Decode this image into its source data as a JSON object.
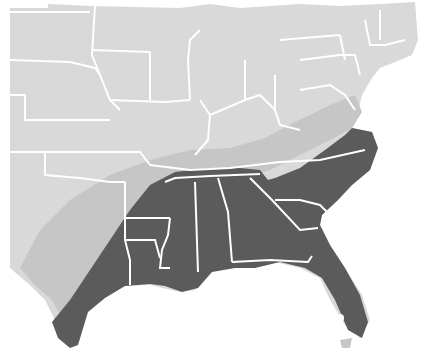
{
  "map": {
    "subject": "Range map of the southeastern United States",
    "region": "Eastern United States",
    "legend": [
      {
        "name": "core-range",
        "color": "#5b5b5b"
      },
      {
        "name": "transition-zone",
        "color": "#c6c6c6"
      },
      {
        "name": "outside-range",
        "color": "#d9d9d9"
      }
    ],
    "colors": {
      "background": "#ffffff",
      "land": "#d9d9d9",
      "transition": "#c6c6c6",
      "range": "#5b5b5b",
      "border": "#ffffff"
    },
    "states_in_core_range": [
      "Texas (east)",
      "Louisiana",
      "Arkansas (south)",
      "Mississippi",
      "Alabama",
      "Georgia",
      "Florida",
      "South Carolina",
      "North Carolina",
      "Tennessee (south)",
      "Virginia (southeast)",
      "Maryland (east)",
      "Delaware"
    ]
  }
}
